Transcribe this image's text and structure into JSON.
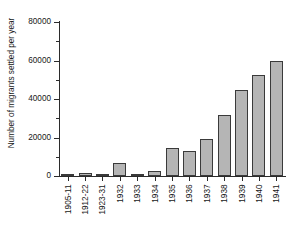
{
  "chart_data": {
    "type": "bar",
    "title": "",
    "xlabel": "",
    "ylabel": "Number of migrants settled per year",
    "categories": [
      "1905-11",
      "1912-22",
      "1923-31",
      "1932",
      "1933",
      "1934",
      "1935",
      "1936",
      "1937",
      "1938",
      "1939",
      "1940",
      "1941"
    ],
    "values": [
      1000,
      1700,
      600,
      6800,
      500,
      2400,
      14400,
      13000,
      19400,
      31700,
      44800,
      52500,
      59700
    ],
    "ylim": [
      0,
      80000
    ],
    "ytick_labels": [
      "0",
      "20000",
      "40000",
      "60000",
      "80000"
    ],
    "ytick_values": [
      0,
      20000,
      40000,
      60000,
      80000
    ],
    "yminor_values": [
      10000,
      30000,
      50000,
      70000
    ],
    "grid": false,
    "legend": null,
    "bar_color": "#b5b5b5",
    "bar_edge_color": "#3a3a3a",
    "axis_color": "#2b2b2b",
    "background": "#ffffff"
  }
}
